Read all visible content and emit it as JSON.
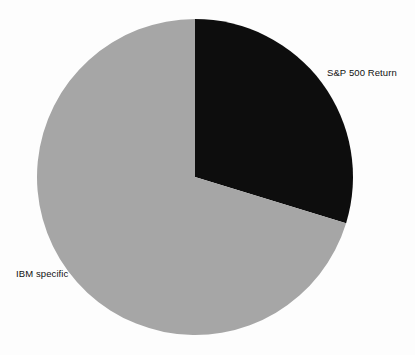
{
  "chart_data": {
    "type": "pie",
    "title": "",
    "subtitle": "",
    "xlabel": "",
    "ylabel": "",
    "grid": false,
    "legend_position": "none",
    "label_placement": "outside",
    "start_angle_deg": 0,
    "direction": "clockwise",
    "categories": [
      "S&P 500 Return",
      "IBM specific"
    ],
    "values": [
      29.7,
      70.3
    ],
    "units": "percent",
    "slices": [
      {
        "label": "S&P 500 Return",
        "value": 29.7,
        "color": "#0d0d0d",
        "start_angle_deg": 0,
        "end_angle_deg": 107,
        "label_x": 327,
        "label_y": 68
      },
      {
        "label": "IBM specific",
        "value": 70.3,
        "color": "#a6a6a6",
        "start_angle_deg": 107,
        "end_angle_deg": 360,
        "label_x": 16,
        "label_y": 269
      }
    ],
    "annotations": []
  },
  "geometry": {
    "center_x": 195,
    "center_y": 177,
    "radius": 158
  },
  "colors": {
    "background": "#fdfdfd",
    "slice_dark": "#0d0d0d",
    "slice_gray": "#a6a6a6",
    "label_text": "#111111"
  },
  "labels": {
    "sp500": "S&P 500 Return",
    "ibm": "IBM specific"
  }
}
